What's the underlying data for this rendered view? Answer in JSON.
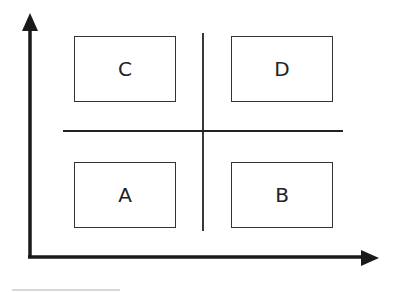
{
  "diagram": {
    "type": "2x2 quadrant matrix",
    "quadrants": {
      "top_left": {
        "label": "C"
      },
      "top_right": {
        "label": "D"
      },
      "bottom_left": {
        "label": "A"
      },
      "bottom_right": {
        "label": "B"
      }
    },
    "axes": {
      "x": "horizontal arrow (no label)",
      "y": "vertical arrow (no label)"
    },
    "colors": {
      "line": "#1a1a1a",
      "background": "#ffffff"
    }
  }
}
